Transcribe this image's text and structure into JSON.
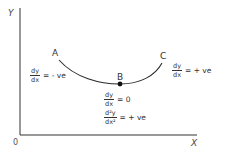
{
  "diagram": {
    "axes": {
      "y_label": "Y",
      "x_label": "X",
      "origin_label": "0"
    },
    "points": {
      "A": "A",
      "B": "B",
      "C": "C"
    },
    "equations": {
      "left": {
        "num": "dy",
        "den": "dx",
        "rhs": "= - ve"
      },
      "right": {
        "num": "dy",
        "den": "dx",
        "rhs": "= + ve"
      },
      "first_derivative_at_B": {
        "num": "dy",
        "den": "dx",
        "rhs": "= 0"
      },
      "second_derivative_at_B": {
        "num": "d²y",
        "den": "dx²",
        "rhs": "= + ve"
      }
    },
    "colors": {
      "line": "#2a2a2a",
      "axis": "#333333",
      "background": "#ffffff"
    }
  }
}
